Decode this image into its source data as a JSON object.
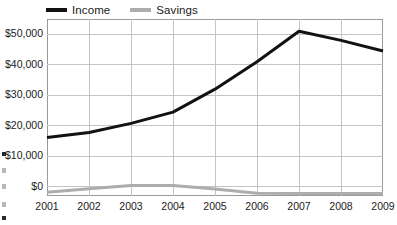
{
  "chart_data": {
    "type": "line",
    "title": "",
    "subtitle": "",
    "xlabel": "",
    "ylabel": "",
    "categories": [
      "2001",
      "2002",
      "2003",
      "2004",
      "2005",
      "2006",
      "2007",
      "2008",
      "2009"
    ],
    "x": [
      2001,
      2002,
      2003,
      2004,
      2005,
      2006,
      2007,
      2008,
      2009
    ],
    "series": [
      {
        "name": "Income",
        "color": "#121212",
        "line_width": 3,
        "values": [
          16200,
          17800,
          20800,
          24500,
          32000,
          41000,
          51000,
          48000,
          44500
        ]
      },
      {
        "name": "Savings",
        "color": "#adadad",
        "line_width": 3,
        "values": [
          -1800,
          -600,
          400,
          400,
          -700,
          -2100,
          -2200,
          -2200,
          -2200
        ]
      }
    ],
    "ylim": [
      -3000,
      55000
    ],
    "ytick_values": [
      0,
      10000,
      20000,
      30000,
      40000,
      50000
    ],
    "ytick_labels": [
      "$0",
      "$10,000",
      "$20,000",
      "$30,000",
      "$40,000",
      "$50,000"
    ],
    "grid": true,
    "grid_horizontal": true,
    "grid_vertical": true,
    "grid_color": "#c4c4c4",
    "frame_color": "#9a9a9a",
    "legend_position": "top-left",
    "legend_entries": [
      "Income",
      "Savings"
    ],
    "background": "#ffffff"
  },
  "legend": {
    "items": [
      {
        "label": "Income",
        "color": "#121212"
      },
      {
        "label": "Savings",
        "color": "#adadad"
      }
    ]
  },
  "axes": {
    "y": {
      "labels": [
        "$50,000",
        "$40,000",
        "$30,000",
        "$20,000",
        "$10,000",
        "$0"
      ]
    },
    "x": {
      "labels": [
        "2001",
        "2002",
        "2003",
        "2004",
        "2005",
        "2006",
        "2007",
        "2008",
        "2009"
      ]
    }
  }
}
